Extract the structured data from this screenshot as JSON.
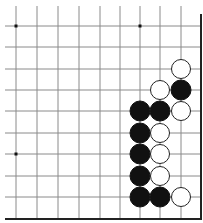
{
  "board": {
    "description": "Go board fragment (lower-right corner)",
    "columns_x": [
      16,
      37,
      58,
      79,
      100,
      120,
      140,
      160,
      181
    ],
    "rows_y": [
      26,
      47,
      69,
      90,
      111,
      133,
      154,
      176,
      197
    ],
    "edge_right_x": 201,
    "edge_bottom_y": 219,
    "line_color": "#8a8a8a",
    "edge_color": "#222222",
    "star_points": [
      [
        0,
        0
      ],
      [
        6,
        0
      ],
      [
        0,
        6
      ]
    ],
    "stones": [
      {
        "col": 8,
        "row": 2,
        "color": "white"
      },
      {
        "col": 7,
        "row": 3,
        "color": "white"
      },
      {
        "col": 8,
        "row": 3,
        "color": "black"
      },
      {
        "col": 6,
        "row": 4,
        "color": "black"
      },
      {
        "col": 7,
        "row": 4,
        "color": "black"
      },
      {
        "col": 8,
        "row": 4,
        "color": "white"
      },
      {
        "col": 6,
        "row": 5,
        "color": "black"
      },
      {
        "col": 7,
        "row": 5,
        "color": "white"
      },
      {
        "col": 6,
        "row": 6,
        "color": "black"
      },
      {
        "col": 7,
        "row": 6,
        "color": "white"
      },
      {
        "col": 6,
        "row": 7,
        "color": "black"
      },
      {
        "col": 7,
        "row": 7,
        "color": "white"
      },
      {
        "col": 6,
        "row": 8,
        "color": "black"
      },
      {
        "col": 7,
        "row": 8,
        "color": "black"
      },
      {
        "col": 8,
        "row": 8,
        "color": "white"
      }
    ]
  }
}
